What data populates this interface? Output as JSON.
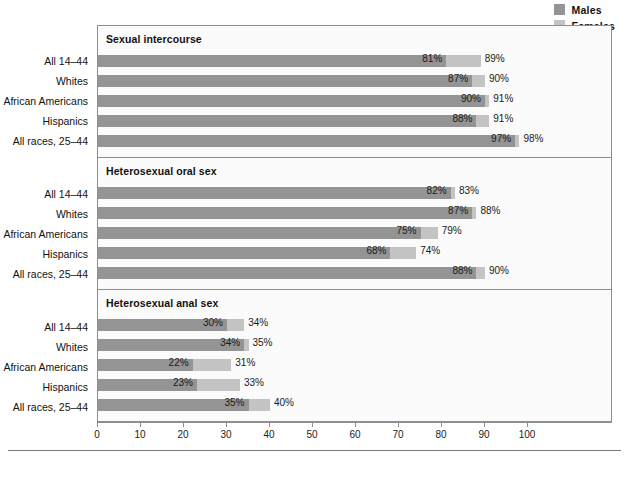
{
  "legend": {
    "items": [
      {
        "label": "Males",
        "color": "#949494",
        "icon": "square-swatch-icon"
      },
      {
        "label": "Females",
        "color": "#c4c4c4",
        "icon": "square-swatch-icon"
      }
    ]
  },
  "axis": {
    "ticks": [
      "0",
      "10",
      "20",
      "30",
      "40",
      "50",
      "60",
      "70",
      "80",
      "90",
      "100"
    ],
    "min": 0,
    "max": 100,
    "step": 10
  },
  "categories": [
    "All 14–44",
    "Whites",
    "African Americans",
    "Hispanics",
    "All races, 25–44"
  ],
  "panels": [
    {
      "title": "Sexual intercourse",
      "rows": [
        {
          "label": "All 14–44",
          "male": 81,
          "female": 89,
          "male_text": "81%",
          "female_text": "89%"
        },
        {
          "label": "Whites",
          "male": 87,
          "female": 90,
          "male_text": "87%",
          "female_text": "90%"
        },
        {
          "label": "African Americans",
          "male": 90,
          "female": 91,
          "male_text": "90%",
          "female_text": "91%"
        },
        {
          "label": "Hispanics",
          "male": 88,
          "female": 91,
          "male_text": "88%",
          "female_text": "91%"
        },
        {
          "label": "All races, 25–44",
          "male": 97,
          "female": 98,
          "male_text": "97%",
          "female_text": "98%"
        }
      ]
    },
    {
      "title": "Heterosexual oral sex",
      "rows": [
        {
          "label": "All 14–44",
          "male": 82,
          "female": 83,
          "male_text": "82%",
          "female_text": "83%"
        },
        {
          "label": "Whites",
          "male": 87,
          "female": 88,
          "male_text": "87%",
          "female_text": "88%"
        },
        {
          "label": "African Americans",
          "male": 75,
          "female": 79,
          "male_text": "75%",
          "female_text": "79%"
        },
        {
          "label": "Hispanics",
          "male": 68,
          "female": 74,
          "male_text": "68%",
          "female_text": "74%"
        },
        {
          "label": "All races, 25–44",
          "male": 88,
          "female": 90,
          "male_text": "88%",
          "female_text": "90%"
        }
      ]
    },
    {
      "title": "Heterosexual anal sex",
      "rows": [
        {
          "label": "All 14–44",
          "male": 30,
          "female": 34,
          "male_text": "30%",
          "female_text": "34%"
        },
        {
          "label": "Whites",
          "male": 34,
          "female": 35,
          "male_text": "34%",
          "female_text": "35%"
        },
        {
          "label": "African Americans",
          "male": 22,
          "female": 31,
          "male_text": "22%",
          "female_text": "31%"
        },
        {
          "label": "Hispanics",
          "male": 23,
          "female": 33,
          "male_text": "23%",
          "female_text": "33%"
        },
        {
          "label": "All races, 25–44",
          "male": 35,
          "female": 40,
          "male_text": "35%",
          "female_text": "40%"
        }
      ]
    }
  ],
  "chart_data": {
    "type": "bar",
    "title": "",
    "orientation": "horizontal",
    "xlabel": "",
    "ylabel": "",
    "xlim": [
      0,
      100
    ],
    "xticks": [
      0,
      10,
      20,
      30,
      40,
      50,
      60,
      70,
      80,
      90,
      100
    ],
    "grid": false,
    "legend": [
      "Males",
      "Females"
    ],
    "legend_position": "top-right",
    "colors": {
      "Males": "#949494",
      "Females": "#c4c4c4"
    },
    "categories": [
      "All 14–44",
      "Whites",
      "African Americans",
      "Hispanics",
      "All races, 25–44"
    ],
    "panels": [
      {
        "title": "Sexual intercourse",
        "series": [
          {
            "name": "Males",
            "values": [
              81,
              87,
              90,
              88,
              97
            ]
          },
          {
            "name": "Females",
            "values": [
              89,
              90,
              91,
              91,
              98
            ]
          }
        ]
      },
      {
        "title": "Heterosexual oral sex",
        "series": [
          {
            "name": "Males",
            "values": [
              82,
              87,
              75,
              68,
              88
            ]
          },
          {
            "name": "Females",
            "values": [
              83,
              88,
              79,
              74,
              90
            ]
          }
        ]
      },
      {
        "title": "Heterosexual anal sex",
        "series": [
          {
            "name": "Males",
            "values": [
              30,
              34,
              22,
              23,
              35
            ]
          },
          {
            "name": "Females",
            "values": [
              34,
              35,
              31,
              33,
              40
            ]
          }
        ]
      }
    ]
  }
}
